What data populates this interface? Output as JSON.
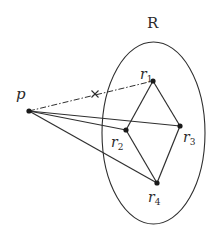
{
  "diagram": {
    "region_label": "R",
    "point_label": "p",
    "nodes": [
      {
        "id": "r1",
        "base": "r",
        "sub": "1",
        "x": 153,
        "y": 81,
        "lx": 140,
        "ly": 78
      },
      {
        "id": "r2",
        "base": "r",
        "sub": "2",
        "x": 126,
        "y": 130,
        "lx": 111,
        "ly": 149
      },
      {
        "id": "r3",
        "base": "r",
        "sub": "3",
        "x": 180,
        "y": 126,
        "lx": 183,
        "ly": 143
      },
      {
        "id": "r4",
        "base": "r",
        "sub": "4",
        "x": 157,
        "y": 183,
        "lx": 147,
        "ly": 203
      }
    ],
    "p": {
      "x": 29,
      "y": 111
    },
    "blocked_edge": {
      "from": "p",
      "to": "r1",
      "style": "dash-dot",
      "cross_marker": {
        "x": 95,
        "y": 94
      }
    },
    "edges_from_p": [
      "r2",
      "r3",
      "r4"
    ],
    "polygon_edges": [
      [
        "r1",
        "r2"
      ],
      [
        "r1",
        "r3"
      ],
      [
        "r2",
        "r4"
      ],
      [
        "r3",
        "r4"
      ]
    ],
    "region": {
      "shape": "ellipse",
      "cx": 153.5,
      "cy": 133,
      "rx": 51.5,
      "ry": 91
    },
    "colors": {
      "stroke": "#2f2f2f",
      "node": "#1a1a1a",
      "background": "#ffffff"
    }
  }
}
